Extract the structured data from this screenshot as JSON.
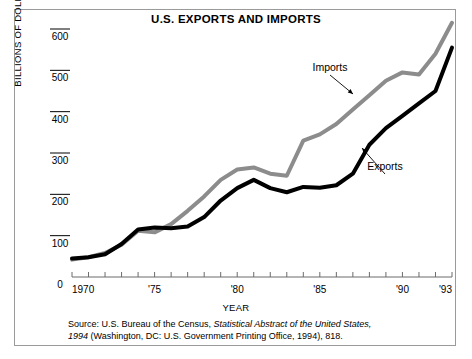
{
  "figure": {
    "title": "U.S. EXPORTS AND IMPORTS",
    "xlabel": "YEAR",
    "ylabel": "BILLIONS OF DOLLARS",
    "source_line1_plain": "Source: U.S. Bureau of the Census, ",
    "source_line1_italic": "Statistical Abstract of the United States,",
    "source_line2_italic": "1994",
    "source_line2_plain": " (Washington, DC: U.S. Government Printing Office, 1994), 818.",
    "source_full": "Source: U.S. Bureau of the Census, Statistical Abstract of the United States, 1994 (Washington, DC: U.S. Government Printing Office, 1994), 818.",
    "frame_color": "#9a9a9a",
    "background": "#ffffff"
  },
  "chart_data": {
    "type": "line",
    "title": "U.S. EXPORTS AND IMPORTS",
    "xlabel": "YEAR",
    "ylabel": "BILLIONS OF DOLLARS",
    "xlim": [
      1970,
      1993
    ],
    "ylim": [
      0,
      600
    ],
    "grid": false,
    "legend_position": "inline-annotations",
    "y_ticks": [
      0,
      100,
      200,
      300,
      400,
      500,
      600
    ],
    "y_tick_labels": [
      "0",
      "100",
      "200",
      "300",
      "400",
      "500",
      "600"
    ],
    "x_ticks": [
      1970,
      1971,
      1972,
      1973,
      1974,
      1975,
      1976,
      1977,
      1978,
      1979,
      1980,
      1981,
      1982,
      1983,
      1984,
      1985,
      1986,
      1987,
      1988,
      1989,
      1990,
      1991,
      1992,
      1993
    ],
    "x_tick_labels": [
      "1970",
      "",
      "",
      "",
      "",
      "'75",
      "",
      "",
      "",
      "",
      "'80",
      "",
      "",
      "",
      "",
      "'85",
      "",
      "",
      "",
      "",
      "'90",
      "",
      "",
      "'93"
    ],
    "x": [
      1970,
      1971,
      1972,
      1973,
      1974,
      1975,
      1976,
      1977,
      1978,
      1979,
      1980,
      1981,
      1982,
      1983,
      1984,
      1985,
      1986,
      1987,
      1988,
      1989,
      1990,
      1991,
      1992,
      1993
    ],
    "series": [
      {
        "name": "Exports",
        "color": "#000000",
        "line_width": 4,
        "values": [
          45,
          48,
          55,
          80,
          115,
          120,
          118,
          122,
          145,
          185,
          215,
          235,
          215,
          205,
          218,
          216,
          222,
          250,
          320,
          360,
          390,
          420,
          450,
          555
        ]
      },
      {
        "name": "Imports",
        "color": "#8c8c8c",
        "line_width": 4,
        "values": [
          42,
          48,
          58,
          78,
          112,
          108,
          128,
          160,
          195,
          235,
          260,
          265,
          250,
          245,
          330,
          345,
          370,
          405,
          440,
          475,
          495,
          490,
          540,
          615
        ]
      }
    ],
    "annotations": [
      {
        "text": "Imports",
        "series": "Imports",
        "x_px": 330,
        "y_px": 71
      },
      {
        "text": "Exports",
        "series": "Exports",
        "x_px": 385,
        "y_px": 170
      }
    ]
  }
}
